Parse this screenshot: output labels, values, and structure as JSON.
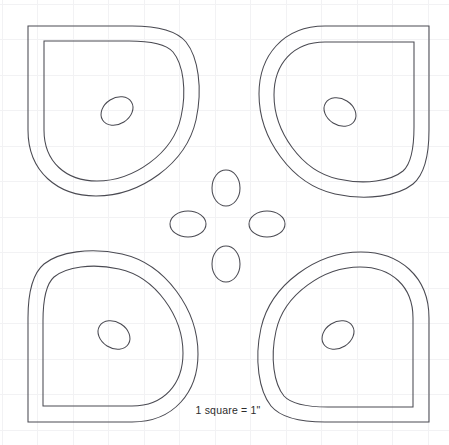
{
  "document": {
    "title": "Applique Pattern Template",
    "type": "quilting-applique-pattern",
    "background_color": "#ffffff",
    "line_color": "#4a4a52",
    "grid_color": "#f2f2f4",
    "width": 449,
    "height": 445
  },
  "caption": {
    "text": "1 square = 1\"",
    "x": 228,
    "y": 414
  },
  "grid": {
    "spacing_px": 35.5,
    "origin_x": 2,
    "origin_y": 4,
    "visible": true,
    "unit_label": "1\""
  },
  "pattern": {
    "name": "four-petal-flower",
    "center_x": 226,
    "center_y": 224,
    "petal_count": 4,
    "petals": [
      {
        "name": "petal-top-left",
        "rotation_deg": 0,
        "eye_cx": 117,
        "eye_cy": 111,
        "eye_rx": 17,
        "eye_ry": 13,
        "eye_rotation_deg": -32
      },
      {
        "name": "petal-top-right",
        "rotation_deg": 90,
        "eye_cx": 340,
        "eye_cy": 112,
        "eye_rx": 17,
        "eye_ry": 13,
        "eye_rotation_deg": 32
      },
      {
        "name": "petal-bottom-right",
        "rotation_deg": 180,
        "eye_cx": 338,
        "eye_cy": 335,
        "eye_rx": 17,
        "eye_ry": 13,
        "eye_rotation_deg": -32
      },
      {
        "name": "petal-bottom-left",
        "rotation_deg": 270,
        "eye_cx": 114,
        "eye_cy": 335,
        "eye_rx": 17,
        "eye_ry": 13,
        "eye_rotation_deg": 32
      }
    ],
    "center_ovals": [
      {
        "name": "center-oval-top",
        "cx": 226,
        "cy": 188,
        "rx": 14,
        "ry": 18
      },
      {
        "name": "center-oval-left",
        "cx": 188,
        "cy": 224,
        "rx": 18,
        "ry": 13
      },
      {
        "name": "center-oval-right",
        "cx": 267,
        "cy": 224,
        "rx": 18,
        "ry": 13
      },
      {
        "name": "center-oval-bottom",
        "cx": 226,
        "cy": 264,
        "rx": 14,
        "ry": 18
      }
    ]
  }
}
